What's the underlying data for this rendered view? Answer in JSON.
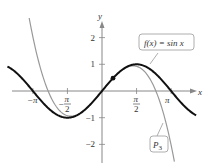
{
  "chart_data": {
    "type": "line",
    "title": "",
    "xlabel": "x",
    "ylabel": "y",
    "xlim": [
      -4.3,
      4.3
    ],
    "ylim": [
      -2.4,
      2.7
    ],
    "grid": false,
    "x_ticks": [
      {
        "value": -3.14159,
        "label": "−π"
      },
      {
        "value": -1.5708,
        "label": "−π/2",
        "num": "π",
        "den": "2",
        "neg": true
      },
      {
        "value": 1.5708,
        "label": "π/2",
        "num": "π",
        "den": "2",
        "neg": false
      },
      {
        "value": 3.14159,
        "label": "π"
      }
    ],
    "y_ticks": [
      {
        "value": 2,
        "label": "2"
      },
      {
        "value": 1,
        "label": "1"
      },
      {
        "value": -1,
        "label": "−1"
      },
      {
        "value": -2,
        "label": "−2"
      }
    ],
    "series": [
      {
        "name": "f(x) = sin x",
        "expr": "sin(x)",
        "color": "#111111",
        "width": 2
      },
      {
        "name": "P3",
        "expr": "x - x^3/6",
        "color": "#999999",
        "width": 1.2
      }
    ],
    "annotations": [
      {
        "text": "f(x) = sin x",
        "target": "sin curve"
      },
      {
        "text": "P3",
        "target": "cubic Taylor polynomial"
      }
    ],
    "point": {
      "x": 0.5,
      "y": 0.479
    }
  },
  "labels": {
    "x_axis": "x",
    "y_axis": "y",
    "f_label": "f(x) = sin x",
    "p3_main": "P",
    "p3_sub": "3"
  }
}
